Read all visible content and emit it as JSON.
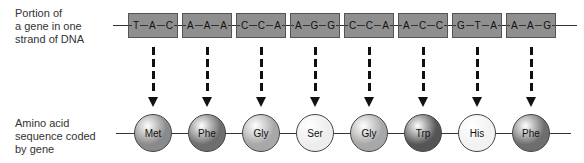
{
  "labels": {
    "dna": [
      "Portion of",
      "a gene in one",
      "strand of DNA"
    ],
    "amino": [
      "Amino acid",
      "sequence coded",
      "by gene"
    ]
  },
  "codons": [
    {
      "bases": [
        "T",
        "A",
        "C"
      ]
    },
    {
      "bases": [
        "A",
        "A",
        "A"
      ]
    },
    {
      "bases": [
        "C",
        "C",
        "A"
      ]
    },
    {
      "bases": [
        "A",
        "G",
        "G"
      ]
    },
    {
      "bases": [
        "C",
        "C",
        "A"
      ]
    },
    {
      "bases": [
        "A",
        "C",
        "C"
      ]
    },
    {
      "bases": [
        "G",
        "T",
        "A"
      ]
    },
    {
      "bases": [
        "A",
        "A",
        "G"
      ]
    }
  ],
  "amino_acids": [
    {
      "name": "Met",
      "color": "#8a8a8a"
    },
    {
      "name": "Phe",
      "color": "#6e6e6e"
    },
    {
      "name": "Gly",
      "color": "#a8a8a8"
    },
    {
      "name": "Ser",
      "color": "#ededed"
    },
    {
      "name": "Gly",
      "color": "#a8a8a8"
    },
    {
      "name": "Trp",
      "color": "#555555"
    },
    {
      "name": "His",
      "color": "#f2f2f2"
    },
    {
      "name": "Phe",
      "color": "#6e6e6e"
    }
  ],
  "colors": {
    "codon_fill": "#8f8f8f",
    "codon_border": "#555555",
    "arrow": "#111111"
  }
}
